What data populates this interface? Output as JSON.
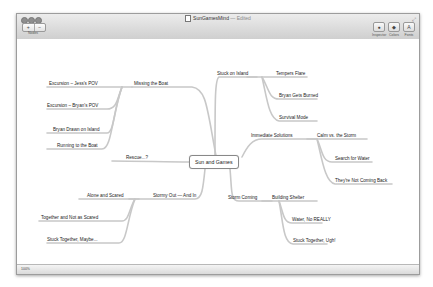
{
  "window": {
    "title": "SunGamesMind",
    "status_suffix": "— Edited",
    "traffic_lights": [
      "close",
      "minimize",
      "zoom"
    ]
  },
  "toolbar": {
    "add_node_label": "+",
    "remove_node_label": "−",
    "nodes_label": "Nodes",
    "inspector_label": "Inspector",
    "colors_label": "Colors",
    "fonts_label": "Fonts",
    "inspector_icon": "inspector-icon",
    "colors_icon": "colors-icon",
    "fonts_icon": "fonts-icon"
  },
  "statusbar": {
    "zoom_text": "100%"
  },
  "mindmap": {
    "center": "Sun and Games",
    "branches": [
      {
        "label": "Missing the Boat",
        "children": [
          "Excursion – Jess's POV",
          "Excursion – Bryan's POV",
          "Bryan Drawn on Island",
          "Running to the Boat"
        ]
      },
      {
        "label": "Rescue...?",
        "children": []
      },
      {
        "label": "Stormy Out — And In",
        "children": [
          "Alone and Scared",
          "Together and Not as Scared",
          "Stuck Together, Maybe..."
        ]
      },
      {
        "label": "Stuck on Island",
        "children": [
          "Tempers Flare",
          "Bryan Gets Burned",
          "Survival Mode"
        ]
      },
      {
        "label": "Immediate Solutions",
        "children": [
          "Calm vs. the Storm",
          "Search for Water",
          "They're Not Coming Back"
        ]
      },
      {
        "label": "Storm Coming",
        "children": [
          "Building Shelter",
          "Water, No REALLY",
          "Stuck Together, Ugh!"
        ]
      }
    ]
  },
  "colors": {
    "link": "#c9c9c9",
    "link_dark": "#9a9a9a"
  }
}
